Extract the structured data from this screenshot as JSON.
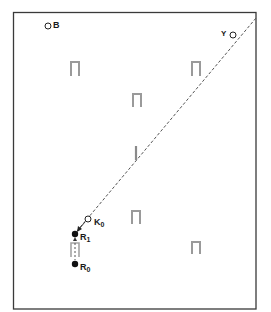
{
  "diagram": {
    "frame": {
      "x": 13,
      "y": 12,
      "width": 243,
      "height": 297,
      "stroke": "#3a3a3a"
    },
    "labels": {
      "B": "B",
      "Y": "Y",
      "K": "K",
      "K_sub": "0",
      "R1": "R",
      "R1_sub": "1",
      "R0": "R",
      "R0_sub": "0"
    },
    "points": [
      {
        "id": "B",
        "type": "open-circle",
        "x": 48,
        "y": 26
      },
      {
        "id": "Y",
        "type": "open-circle",
        "x": 233,
        "y": 34
      },
      {
        "id": "K0",
        "type": "open-circle",
        "x": 88,
        "y": 219
      },
      {
        "id": "R1",
        "type": "filled-circle",
        "x": 75,
        "y": 234
      },
      {
        "id": "R0",
        "type": "filled-circle",
        "x": 75,
        "y": 264
      }
    ],
    "markers": [
      {
        "id": "staple-1",
        "x": 70,
        "y": 61,
        "w": 10,
        "h": 15
      },
      {
        "id": "staple-2",
        "x": 191,
        "y": 61,
        "w": 10,
        "h": 15
      },
      {
        "id": "staple-3",
        "x": 132,
        "y": 93,
        "w": 10,
        "h": 14
      },
      {
        "id": "staple-4",
        "x": 131,
        "y": 210,
        "w": 10,
        "h": 14
      },
      {
        "id": "staple-5",
        "x": 191,
        "y": 241,
        "w": 10,
        "h": 13
      },
      {
        "id": "staple-6",
        "x": 70,
        "y": 242,
        "w": 10,
        "h": 15
      }
    ],
    "vertical_mark": {
      "x": 136,
      "y1": 146,
      "y2": 160
    },
    "dashed_line": {
      "x1": 75,
      "y1": 234,
      "x2": 256,
      "y2": 18
    },
    "dashed_segment": {
      "x1": 75,
      "y1": 240,
      "x2": 75,
      "y2": 260
    },
    "colors": {
      "ink": "#1a1a1a",
      "marker": "#9a9a9a",
      "dash": "#555555"
    }
  }
}
